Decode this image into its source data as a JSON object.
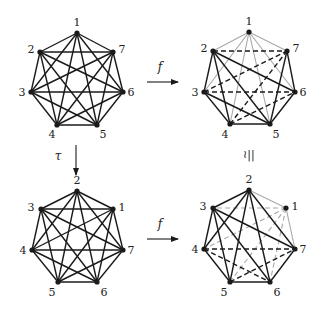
{
  "colors": {
    "black": "#1a1a1a",
    "gray": "#a8a8a8",
    "background": "#ffffff"
  },
  "arrows": [
    {
      "id": "top-f",
      "label": "f",
      "x1": 147,
      "y1": 82,
      "x2": 178,
      "y2": 82,
      "lx": 160,
      "ly": 71
    },
    {
      "id": "bottom-f",
      "label": "f",
      "x1": 147,
      "y1": 239,
      "x2": 178,
      "y2": 239,
      "lx": 160,
      "ly": 228
    },
    {
      "id": "tau",
      "label": "τ",
      "x1": 76,
      "y1": 145,
      "x2": 76,
      "y2": 175,
      "lx": 58,
      "ly": 160
    }
  ],
  "iso_symbol": {
    "label": "≀||",
    "x": 249,
    "y": 158
  },
  "graphs": [
    {
      "id": "top-left",
      "nodes": {
        "1": [
          77,
          33
        ],
        "2": [
          40,
          52
        ],
        "7": [
          113,
          52
        ],
        "3": [
          31,
          92
        ],
        "6": [
          123,
          92
        ],
        "4": [
          57,
          125
        ],
        "5": [
          97,
          125
        ]
      },
      "labels": {
        "1": [
          77,
          26
        ],
        "2": [
          31,
          53
        ],
        "7": [
          122,
          53
        ],
        "3": [
          22,
          96
        ],
        "6": [
          131,
          96
        ],
        "4": [
          52,
          138
        ],
        "5": [
          103,
          138
        ]
      },
      "edges": [
        [
          "1",
          "2",
          "s"
        ],
        [
          "1",
          "3",
          "s"
        ],
        [
          "1",
          "4",
          "s"
        ],
        [
          "1",
          "5",
          "s"
        ],
        [
          "1",
          "6",
          "s"
        ],
        [
          "1",
          "7",
          "s"
        ],
        [
          "2",
          "3",
          "s"
        ],
        [
          "2",
          "4",
          "s"
        ],
        [
          "2",
          "5",
          "s"
        ],
        [
          "2",
          "6",
          "s"
        ],
        [
          "2",
          "7",
          "s"
        ],
        [
          "3",
          "4",
          "s"
        ],
        [
          "3",
          "5",
          "s"
        ],
        [
          "3",
          "6",
          "s"
        ],
        [
          "3",
          "7",
          "s"
        ],
        [
          "4",
          "5",
          "s"
        ],
        [
          "4",
          "6",
          "s"
        ],
        [
          "4",
          "7",
          "s"
        ],
        [
          "5",
          "6",
          "s"
        ],
        [
          "5",
          "7",
          "s"
        ],
        [
          "6",
          "7",
          "s"
        ]
      ]
    },
    {
      "id": "top-right",
      "nodes": {
        "1": [
          249,
          32
        ],
        "2": [
          213,
          51
        ],
        "7": [
          287,
          51
        ],
        "3": [
          204,
          92
        ],
        "6": [
          295,
          92
        ],
        "4": [
          230,
          124
        ],
        "5": [
          270,
          124
        ]
      },
      "labels": {
        "1": [
          249,
          25
        ],
        "2": [
          204,
          52
        ],
        "7": [
          296,
          52
        ],
        "3": [
          195,
          96
        ],
        "6": [
          303,
          96
        ],
        "4": [
          225,
          138
        ],
        "5": [
          276,
          138
        ]
      },
      "edges": [
        [
          "1",
          "2",
          "g"
        ],
        [
          "1",
          "3",
          "g"
        ],
        [
          "1",
          "4",
          "g"
        ],
        [
          "1",
          "5",
          "g"
        ],
        [
          "1",
          "6",
          "g"
        ],
        [
          "1",
          "7",
          "g"
        ],
        [
          "2",
          "3",
          "s"
        ],
        [
          "3",
          "4",
          "s"
        ],
        [
          "4",
          "5",
          "s"
        ],
        [
          "5",
          "6",
          "s"
        ],
        [
          "6",
          "7",
          "s"
        ],
        [
          "2",
          "4",
          "s"
        ],
        [
          "2",
          "5",
          "s"
        ],
        [
          "2",
          "6",
          "s"
        ],
        [
          "3",
          "5",
          "s"
        ],
        [
          "5",
          "7",
          "s"
        ],
        [
          "2",
          "7",
          "d"
        ],
        [
          "3",
          "6",
          "d"
        ],
        [
          "3",
          "7",
          "d"
        ],
        [
          "4",
          "6",
          "d"
        ],
        [
          "4",
          "7",
          "d"
        ]
      ]
    },
    {
      "id": "bottom-left",
      "nodes": {
        "2": [
          77,
          191
        ],
        "3": [
          41,
          209
        ],
        "1": [
          113,
          209
        ],
        "4": [
          32,
          250
        ],
        "7": [
          123,
          250
        ],
        "5": [
          58,
          282
        ],
        "6": [
          97,
          282
        ]
      },
      "labels": {
        "2": [
          77,
          184
        ],
        "3": [
          31,
          211
        ],
        "1": [
          122,
          211
        ],
        "4": [
          23,
          254
        ],
        "7": [
          131,
          254
        ],
        "5": [
          52,
          296
        ],
        "6": [
          104,
          296
        ]
      },
      "edges": [
        [
          "1",
          "2",
          "s"
        ],
        [
          "1",
          "3",
          "s"
        ],
        [
          "1",
          "4",
          "s"
        ],
        [
          "1",
          "5",
          "s"
        ],
        [
          "1",
          "6",
          "s"
        ],
        [
          "1",
          "7",
          "s"
        ],
        [
          "2",
          "3",
          "s"
        ],
        [
          "2",
          "4",
          "s"
        ],
        [
          "2",
          "5",
          "s"
        ],
        [
          "2",
          "6",
          "s"
        ],
        [
          "2",
          "7",
          "s"
        ],
        [
          "3",
          "4",
          "s"
        ],
        [
          "3",
          "5",
          "s"
        ],
        [
          "3",
          "6",
          "s"
        ],
        [
          "3",
          "7",
          "s"
        ],
        [
          "4",
          "5",
          "s"
        ],
        [
          "4",
          "6",
          "s"
        ],
        [
          "4",
          "7",
          "s"
        ],
        [
          "5",
          "6",
          "s"
        ],
        [
          "5",
          "7",
          "s"
        ],
        [
          "6",
          "7",
          "s"
        ]
      ]
    },
    {
      "id": "bottom-right",
      "nodes": {
        "2": [
          249,
          190
        ],
        "3": [
          213,
          208
        ],
        "1": [
          286,
          208
        ],
        "4": [
          204,
          249
        ],
        "7": [
          295,
          249
        ],
        "5": [
          230,
          282
        ],
        "6": [
          270,
          282
        ]
      },
      "labels": {
        "2": [
          249,
          183
        ],
        "3": [
          203,
          210
        ],
        "1": [
          295,
          210
        ],
        "4": [
          195,
          253
        ],
        "7": [
          303,
          253
        ],
        "5": [
          224,
          296
        ],
        "6": [
          277,
          296
        ]
      },
      "edges": [
        [
          "1",
          "2",
          "g"
        ],
        [
          "1",
          "7",
          "g"
        ],
        [
          "1",
          "3",
          "gd"
        ],
        [
          "1",
          "4",
          "gd"
        ],
        [
          "1",
          "5",
          "gd"
        ],
        [
          "1",
          "6",
          "gd"
        ],
        [
          "2",
          "3",
          "s"
        ],
        [
          "2",
          "4",
          "s"
        ],
        [
          "2",
          "5",
          "s"
        ],
        [
          "2",
          "6",
          "s"
        ],
        [
          "2",
          "7",
          "s"
        ],
        [
          "3",
          "4",
          "s"
        ],
        [
          "3",
          "5",
          "s"
        ],
        [
          "3",
          "6",
          "s"
        ],
        [
          "3",
          "7",
          "s"
        ],
        [
          "4",
          "5",
          "s"
        ],
        [
          "5",
          "6",
          "s"
        ],
        [
          "6",
          "7",
          "s"
        ],
        [
          "4",
          "7",
          "d"
        ],
        [
          "4",
          "6",
          "d"
        ],
        [
          "5",
          "7",
          "d"
        ]
      ]
    }
  ]
}
